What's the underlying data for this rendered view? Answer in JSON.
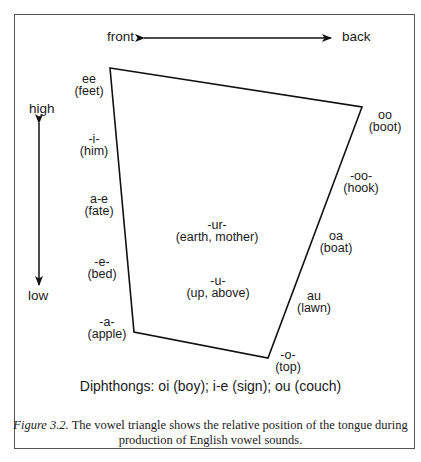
{
  "axes": {
    "horizontal": {
      "left": "front",
      "right": "back"
    },
    "vertical": {
      "top": "high",
      "bottom": "low"
    }
  },
  "vowels": [
    {
      "id": "ee",
      "spelling": "ee",
      "example": "(feet)",
      "side": "front",
      "height_rank": 1
    },
    {
      "id": "i",
      "spelling": "-i-",
      "example": "(him)",
      "side": "front",
      "height_rank": 2
    },
    {
      "id": "a-e",
      "spelling": "a-e",
      "example": "(fate)",
      "side": "front",
      "height_rank": 3
    },
    {
      "id": "e",
      "spelling": "-e-",
      "example": "(bed)",
      "side": "front",
      "height_rank": 4
    },
    {
      "id": "a",
      "spelling": "-a-",
      "example": "(apple)",
      "side": "front",
      "height_rank": 5
    },
    {
      "id": "oo",
      "spelling": "oo",
      "example": "(boot)",
      "side": "back",
      "height_rank": 1
    },
    {
      "id": "oo-short",
      "spelling": "-oo-",
      "example": "(hook)",
      "side": "back",
      "height_rank": 2
    },
    {
      "id": "oa",
      "spelling": "oa",
      "example": "(boat)",
      "side": "back",
      "height_rank": 3
    },
    {
      "id": "au",
      "spelling": "au",
      "example": "(lawn)",
      "side": "back",
      "height_rank": 4
    },
    {
      "id": "o",
      "spelling": "-o-",
      "example": "(top)",
      "side": "back",
      "height_rank": 5
    },
    {
      "id": "ur",
      "spelling": "-ur-",
      "example": "(earth, mother)",
      "side": "central",
      "height_rank": 3
    },
    {
      "id": "u",
      "spelling": "-u-",
      "example": "(up, above)",
      "side": "central",
      "height_rank": 4
    }
  ],
  "diphthongs": "Diphthongs: oi (boy); i-e (sign); ou (couch)",
  "caption": {
    "label": "Figure 3.2.",
    "text": " The vowel triangle shows the relative position of the tongue during production of English vowel sounds."
  }
}
